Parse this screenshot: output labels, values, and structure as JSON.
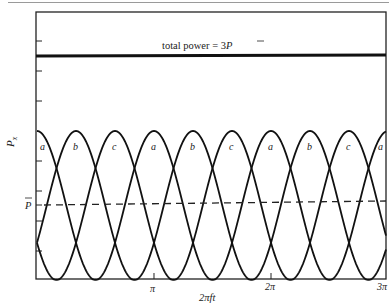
{
  "chart_data": {
    "type": "line",
    "title": "",
    "xlabel": "2πft",
    "ylabel": "P_x",
    "x_ticks": [
      {
        "value": 3.14159,
        "label": "π"
      },
      {
        "value": 6.28319,
        "label": "2π"
      },
      {
        "value": 9.42478,
        "label": "3π"
      }
    ],
    "xlim": [
      0,
      9.42478
    ],
    "ylim": [
      0,
      3.0
    ],
    "y_ticks_unlabeled": [
      0.4,
      0.8,
      1.2,
      1.6,
      2.0,
      2.4,
      2.8
    ],
    "y_tick_labeled": {
      "value": 1.0,
      "label": "P̄"
    },
    "series": [
      {
        "name": "a",
        "formula": "2*P̄*cos^2(2πft)",
        "style": "solid",
        "phase_deg": 0
      },
      {
        "name": "b",
        "formula": "2*P̄*cos^2(2πft - π/3)",
        "style": "solid",
        "phase_deg": 60
      },
      {
        "name": "c",
        "formula": "2*P̄*cos^2(2πft - 2π/3)",
        "style": "solid",
        "phase_deg": 120
      },
      {
        "name": "total power",
        "value": 3.0,
        "style": "thick-solid"
      },
      {
        "name": "average power P̄",
        "value": 1.0,
        "style": "dashed"
      }
    ],
    "annotations": [
      {
        "text": "total power = 3P̄",
        "near": "total power line"
      }
    ],
    "curve_labels": [
      "a",
      "b",
      "c",
      "a",
      "b",
      "c",
      "a",
      "b",
      "c",
      "a"
    ],
    "grid": false,
    "legend": "none"
  },
  "labels": {
    "total_power": "total power = 3",
    "total_power_sym": "P",
    "pbar": "P",
    "ylabel_main": "P",
    "ylabel_sub": "x",
    "xlabel": "2πft",
    "x_tick_1": "π",
    "x_tick_2": "2π",
    "x_tick_3": "3π"
  }
}
